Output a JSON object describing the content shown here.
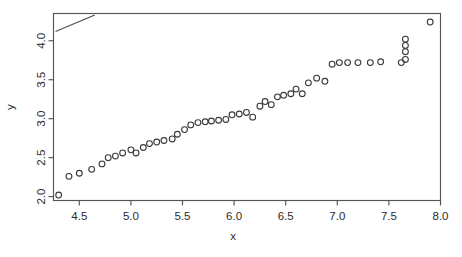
{
  "chart_data": {
    "type": "scatter",
    "title": "",
    "subtitle": "",
    "xlabel": "x",
    "ylabel": "y",
    "xlim": [
      4.25,
      8.0
    ],
    "ylim": [
      1.95,
      4.35
    ],
    "xticks": [
      4.5,
      5.0,
      5.5,
      6.0,
      6.5,
      7.0,
      7.5,
      8.0
    ],
    "xtick_labels": [
      "4.5",
      "5.0",
      "5.5",
      "6.0",
      "6.5",
      "7.0",
      "7.5",
      "8.0"
    ],
    "yticks": [
      2.0,
      2.5,
      3.0,
      3.5,
      4.0
    ],
    "ytick_labels": [
      "2.0",
      "2.5",
      "3.0",
      "3.5",
      "4.0"
    ],
    "grid": false,
    "legend": null,
    "legend_position": "none",
    "point_marker": "open-circle",
    "point_color": "#3a3a3a",
    "frame_color": "#555555",
    "background_color": "#ffffff",
    "annotations": [
      {
        "name": "reference-line",
        "type": "line",
        "x": [
          4.27,
          4.65
        ],
        "y": [
          4.12,
          4.33
        ],
        "color": "#4a4a4a"
      }
    ],
    "x": [
      4.3,
      4.4,
      4.5,
      4.62,
      4.72,
      4.78,
      4.85,
      4.92,
      5.0,
      5.05,
      5.12,
      5.18,
      5.25,
      5.32,
      5.4,
      5.45,
      5.52,
      5.58,
      5.65,
      5.72,
      5.78,
      5.85,
      5.92,
      5.98,
      6.05,
      6.12,
      6.18,
      6.25,
      6.3,
      6.36,
      6.42,
      6.48,
      6.55,
      6.6,
      6.66,
      6.72,
      6.8,
      6.88,
      6.95,
      7.02,
      7.1,
      7.2,
      7.32,
      7.42,
      7.62,
      7.66,
      7.66,
      7.66,
      7.66,
      7.9
    ],
    "y": [
      2.02,
      2.26,
      2.3,
      2.35,
      2.42,
      2.5,
      2.52,
      2.56,
      2.6,
      2.56,
      2.63,
      2.68,
      2.7,
      2.72,
      2.74,
      2.8,
      2.86,
      2.92,
      2.95,
      2.96,
      2.97,
      2.98,
      2.99,
      3.05,
      3.06,
      3.08,
      3.02,
      3.16,
      3.22,
      3.18,
      3.28,
      3.3,
      3.32,
      3.38,
      3.32,
      3.46,
      3.52,
      3.48,
      3.7,
      3.72,
      3.72,
      3.72,
      3.72,
      3.73,
      3.72,
      3.76,
      3.86,
      3.94,
      4.02,
      4.24
    ]
  }
}
